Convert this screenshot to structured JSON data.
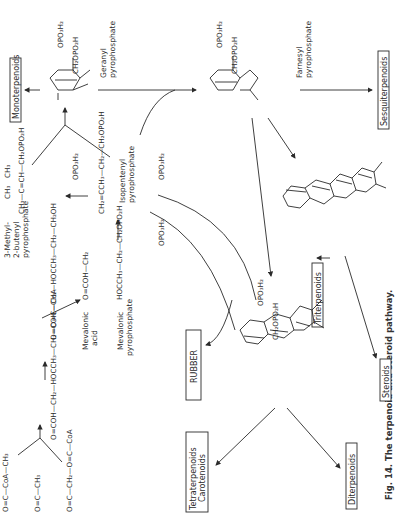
{
  "caption": "Fig. 14. The terpenoid and steroid pathway.",
  "boxes": {
    "monoterpenoids": "Monoterpenoids",
    "sesquiterpenoids": "Sesquiterpenoids",
    "triterpenoids": "Triterpenoids",
    "steroids": "Steroids",
    "rubber": "RUBBER",
    "tetraterpenoids_1": "Tetraterpenoids",
    "tetraterpenoids_2": "Carotenoids",
    "diterpenoids": "Diterpenoids"
  },
  "compounds": {
    "geranyl": [
      "Geranyl",
      "pyrophosphate"
    ],
    "farnesyl": [
      "Farnesyl",
      "pyrophosphate"
    ],
    "isopentenyl": [
      "Isopentenyl",
      "pyrophosphate"
    ],
    "methylbutenyl": [
      "3-Methyl-",
      "2-butenyl",
      "pyrophosphate"
    ],
    "mevalonic_acid": [
      "Mevalonic",
      "acid"
    ],
    "mevalonic_pp": [
      "Mevalonic",
      "pyrophosphate"
    ]
  },
  "formulas": {
    "geranyl_p1": "OPO₃H₂",
    "geranyl_p2": "CH₂OPO₂H",
    "farnesyl_p1": "OPO₃H₂",
    "farnesyl_p2": "CH₂OPO₂H",
    "rubber_p1": "OPO₃H₂",
    "rubber_p2": "CH₂OPO₂H",
    "methylbutenyl_chain": "CH₃—C=CH—CH₂OPO₂H",
    "methylbutenyl_top": "CH₃",
    "methylbutenyl_side": "CH₃",
    "methylbutenyl_p": "OPO₃H₂",
    "isopentenyl_chain": "CH₂=CCH₃—CH₂—CH₂OPO₂H",
    "isopentenyl_p": "OPO₃H₂",
    "mevpp_chain": "HOCCH₃—CH₂—CH₂OPO₂H",
    "mevpp_top": "O=COH—CH₂",
    "mevpp_p": "OPO₃H₂",
    "mevacid_chain": "O=COH—CH₂—HOCCH₃—CH₂—CH₂OH",
    "hmg_chain": "O=COH—CH₂—HOCCH₃—CH₂—O=C—CoA",
    "acetylcoa_1": "O=C—CoA—CH₃",
    "acetylcoa_2": "O=C—CH₃",
    "acetoacetyl": "O=C—CH₂—O=C—CoA"
  }
}
